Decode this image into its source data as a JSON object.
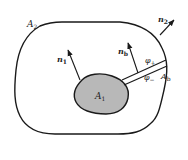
{
  "diagram": {
    "type": "multiply-connected-region",
    "colors": {
      "background": "#ffffff",
      "stroke": "#1a1a1a",
      "inner_fill": "#b8b8b8",
      "text": "#222222"
    },
    "regions": {
      "outer_boundary": {
        "label": "A",
        "sub": "2"
      },
      "inner_boundary": {
        "label": "A",
        "sub": "1"
      },
      "cut": {
        "label": "A",
        "sub": "b"
      }
    },
    "normals": [
      {
        "id": "n1",
        "label": "n",
        "sub": "1"
      },
      {
        "id": "n2",
        "label": "n",
        "sub": "2"
      },
      {
        "id": "nb",
        "label": "n",
        "sub": "b"
      }
    ],
    "cut_sides": [
      {
        "label": "φ",
        "sub": "+"
      },
      {
        "label": "φ",
        "sub": "−"
      }
    ]
  }
}
